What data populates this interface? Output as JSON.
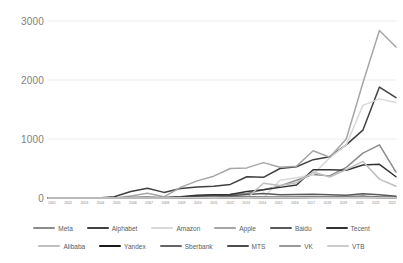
{
  "chart_data": {
    "type": "line",
    "title": "",
    "xlabel": "",
    "ylabel": "",
    "ylim": [
      0,
      3000
    ],
    "yticks": [
      3000,
      2000,
      1000,
      0
    ],
    "grid": true,
    "legend_position": "bottom",
    "categories": [
      "2001",
      "2002",
      "2003",
      "2004",
      "2005",
      "2006",
      "2007",
      "2008",
      "2009",
      "2010",
      "2011",
      "2012",
      "2013",
      "2014",
      "2015",
      "2016",
      "2017",
      "2018",
      "2019",
      "2020",
      "2021",
      "2022"
    ],
    "series": [
      {
        "name": "Meta",
        "color": "#8c8c8c",
        "values": [
          0,
          0,
          0,
          0,
          0,
          0,
          0,
          0,
          0,
          0,
          0,
          60,
          75,
          140,
          205,
          300,
          400,
          375,
          520,
          760,
          900,
          440
        ]
      },
      {
        "name": "Alphabet",
        "color": "#404040",
        "values": [
          0,
          0,
          0,
          0,
          20,
          110,
          165,
          95,
          160,
          185,
          200,
          230,
          360,
          350,
          500,
          530,
          650,
          700,
          900,
          1150,
          1880,
          1700
        ]
      },
      {
        "name": "Amazon",
        "color": "#d9d9d9",
        "values": [
          0,
          0,
          0,
          0,
          0,
          0,
          0,
          0,
          0,
          0,
          0,
          0,
          0,
          0,
          300,
          345,
          400,
          680,
          900,
          1570,
          1680,
          1620
        ]
      },
      {
        "name": "Apple",
        "color": "#a6a6a6",
        "values": [
          0,
          0,
          0,
          0,
          0,
          35,
          80,
          20,
          180,
          290,
          370,
          500,
          510,
          600,
          520,
          540,
          800,
          690,
          1000,
          1950,
          2840,
          2560
        ]
      },
      {
        "name": "Baidu",
        "color": "#595959",
        "values": [
          0,
          0,
          0,
          0,
          0,
          5,
          10,
          5,
          15,
          35,
          50,
          40,
          60,
          75,
          55,
          60,
          65,
          55,
          45,
          70,
          55,
          30
        ]
      },
      {
        "name": "Tecent",
        "color": "#333333",
        "values": [
          0,
          0,
          0,
          0,
          0,
          5,
          10,
          5,
          20,
          45,
          55,
          60,
          110,
          140,
          180,
          220,
          480,
          480,
          470,
          560,
          570,
          360
        ]
      },
      {
        "name": "Alibaba",
        "color": "#bfbfbf",
        "values": [
          0,
          0,
          0,
          0,
          0,
          0,
          0,
          0,
          0,
          0,
          0,
          0,
          0,
          250,
          210,
          260,
          440,
          355,
          480,
          620,
          320,
          200
        ]
      },
      {
        "name": "Yandex",
        "color": "#1a1a1a",
        "values": [
          0,
          0,
          0,
          0,
          0,
          0,
          0,
          0,
          0,
          8,
          12,
          10,
          12,
          10,
          8,
          10,
          12,
          12,
          12,
          25,
          8,
          6
        ]
      },
      {
        "name": "Sberbank",
        "color": "#666666",
        "values": [
          0,
          0,
          0,
          0,
          0,
          0,
          0,
          5,
          8,
          12,
          14,
          12,
          14,
          10,
          8,
          14,
          20,
          22,
          24,
          28,
          18,
          12
        ]
      },
      {
        "name": "MTS",
        "color": "#4d4d4d",
        "values": [
          0,
          0,
          0,
          0,
          0,
          8,
          10,
          4,
          8,
          12,
          12,
          10,
          12,
          10,
          8,
          10,
          12,
          12,
          12,
          14,
          10,
          8
        ]
      },
      {
        "name": "VK",
        "color": "#999999",
        "values": [
          0,
          0,
          0,
          0,
          0,
          0,
          0,
          0,
          0,
          5,
          8,
          6,
          8,
          8,
          6,
          8,
          10,
          10,
          10,
          14,
          8,
          5
        ]
      },
      {
        "name": "VTB",
        "color": "#cccccc",
        "values": [
          0,
          0,
          0,
          0,
          0,
          0,
          0,
          0,
          4,
          6,
          8,
          6,
          8,
          6,
          5,
          6,
          8,
          8,
          8,
          10,
          6,
          4
        ]
      }
    ]
  }
}
